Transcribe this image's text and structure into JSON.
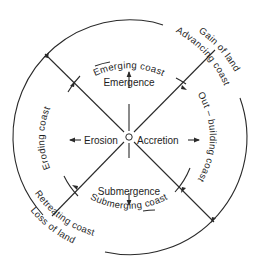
{
  "diagram": {
    "center_marker": "small-circle",
    "stroke_color": "#2a2a2a",
    "text_color": "#1e1e1e",
    "background": "#ffffff",
    "processes": {
      "up": "Emergence",
      "down": "Submergence",
      "left": "Erosion",
      "right": "Accretion"
    },
    "inner_arc_labels": {
      "top": "Emerging coast",
      "right": "Out – building coast",
      "bottom": "Submerging coast",
      "left": "Eroding coast"
    },
    "outer_arc_labels": {
      "upper_right_line1": "Gain of land",
      "upper_right_line2": "Advancing coast",
      "lower_left_line1": "Retreating coast",
      "lower_left_line2": "Loss of land"
    }
  }
}
